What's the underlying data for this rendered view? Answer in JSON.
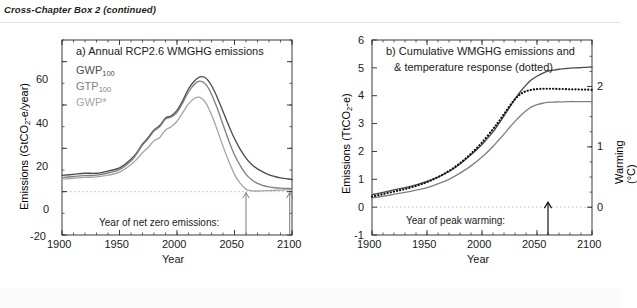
{
  "header": {
    "title": "Cross-Chapter Box 2 (continued)"
  },
  "panel_a": {
    "title": "a) Annual RCP2.6 WMGHG emissions",
    "ylabel": "Emissions (GtCO",
    "ylabel_sub": "2",
    "ylabel_end": "-e/year)",
    "xlabel": "Year",
    "annotation": "Year of net zero emissions:",
    "legend": [
      {
        "label": "GWP",
        "sub": "100",
        "color": "#4d4d4d"
      },
      {
        "label": "GTP",
        "sub": "100",
        "color": "#808080"
      },
      {
        "label": "GWP*",
        "sub": "",
        "color": "#a6a6a6"
      }
    ],
    "yticks": [
      "-20",
      "0",
      "20",
      "40",
      "60"
    ],
    "xticks": [
      "1900",
      "1950",
      "2000",
      "2050",
      "2100"
    ]
  },
  "panel_b": {
    "title_line1": "b) Cumulative WMGHG emissions and",
    "title_line2": "& temperature response (dotted)",
    "ylabel": "Emissions (TtCO",
    "ylabel_sub": "2",
    "ylabel_end": "-e)",
    "ylabel_right": "Warming (°C)",
    "xlabel": "Year",
    "annotation": "Year of peak warming:",
    "yticks": [
      "-1",
      "0",
      "1",
      "2",
      "3",
      "4",
      "5",
      "6"
    ],
    "yticks_right": [
      "0",
      "1",
      "2"
    ],
    "xticks": [
      "1900",
      "1950",
      "2000",
      "2050",
      "2100"
    ]
  },
  "chart_data": [
    {
      "type": "line",
      "panel": "a",
      "title": "a) Annual RCP2.6 WMGHG emissions",
      "xlabel": "Year",
      "ylabel": "Emissions (GtCO2-e/year)",
      "xlim": [
        1900,
        2100
      ],
      "ylim": [
        -20,
        70
      ],
      "yticks": [
        -20,
        0,
        20,
        40,
        60
      ],
      "xticks": [
        1900,
        1950,
        2000,
        2050,
        2100
      ],
      "grid": false,
      "legend_position": "upper-left",
      "zero_line": 0,
      "annotations": [
        {
          "text": "Year of net zero emissions:",
          "x": 2000,
          "y": -12
        },
        {
          "type": "arrow",
          "x": 2060,
          "y": 0,
          "series": "GWP*"
        },
        {
          "type": "arrow",
          "x": 2098,
          "y": 0,
          "series": "GWP100"
        }
      ],
      "x": [
        1900,
        1910,
        1920,
        1930,
        1940,
        1950,
        1960,
        1965,
        1970,
        1975,
        1980,
        1985,
        1990,
        1995,
        2000,
        2005,
        2010,
        2015,
        2020,
        2025,
        2030,
        2035,
        2040,
        2045,
        2050,
        2055,
        2060,
        2065,
        2070,
        2075,
        2080,
        2085,
        2090,
        2095,
        2100
      ],
      "series": [
        {
          "name": "GWP100",
          "color": "#4d4d4d",
          "values": [
            7.5,
            8.0,
            8.5,
            8.5,
            9.5,
            11.0,
            15.0,
            18.0,
            22.0,
            25.0,
            28.5,
            30.5,
            34.0,
            35.0,
            37.5,
            42.0,
            47.5,
            51.0,
            53.0,
            52.5,
            49.0,
            43.5,
            37.0,
            30.5,
            24.5,
            19.5,
            15.5,
            12.5,
            10.5,
            9.0,
            7.8,
            7.0,
            6.4,
            6.0,
            5.6
          ]
        },
        {
          "name": "GTP100",
          "color": "#808080",
          "values": [
            6.5,
            7.0,
            7.4,
            7.6,
            8.6,
            10.2,
            14.2,
            17.5,
            21.5,
            24.5,
            28.0,
            30.0,
            33.5,
            34.5,
            36.5,
            41.0,
            46.0,
            49.5,
            51.0,
            49.5,
            45.0,
            38.5,
            31.0,
            23.5,
            17.0,
            12.0,
            8.0,
            5.5,
            3.8,
            2.8,
            2.2,
            1.8,
            1.6,
            1.5,
            1.4
          ]
        },
        {
          "name": "GWP*",
          "color": "#a6a6a6",
          "values": [
            5.8,
            6.2,
            6.6,
            6.8,
            7.6,
            9.0,
            12.5,
            15.0,
            18.0,
            20.5,
            23.5,
            25.0,
            28.5,
            30.0,
            32.5,
            36.5,
            40.5,
            43.0,
            43.5,
            41.0,
            35.5,
            28.5,
            21.0,
            14.0,
            8.0,
            3.8,
            1.2,
            0.4,
            0.3,
            0.4,
            0.5,
            0.6,
            0.7,
            0.8,
            0.9
          ]
        }
      ]
    },
    {
      "type": "line",
      "panel": "b",
      "title": "b) Cumulative WMGHG emissions and & temperature response (dotted)",
      "xlabel": "Year",
      "ylabel": "Emissions (TtCO2-e)",
      "ylabel_right": "Warming (°C)",
      "xlim": [
        1900,
        2100
      ],
      "ylim": [
        -1,
        6
      ],
      "ylim_right": [
        -0.46,
        2.77
      ],
      "yticks": [
        -1,
        0,
        1,
        2,
        3,
        4,
        5,
        6
      ],
      "yticks_right": [
        0,
        1,
        2
      ],
      "xticks": [
        1900,
        1950,
        2000,
        2050,
        2100
      ],
      "grid": false,
      "zero_line": 0,
      "annotations": [
        {
          "text": "Year of peak warming:",
          "x": 2000,
          "y": -0.55
        },
        {
          "type": "arrow",
          "x": 2060,
          "y": 0
        }
      ],
      "x": [
        1900,
        1910,
        1920,
        1930,
        1940,
        1950,
        1960,
        1970,
        1980,
        1990,
        2000,
        2010,
        2015,
        2020,
        2025,
        2030,
        2035,
        2040,
        2045,
        2050,
        2055,
        2060,
        2065,
        2070,
        2075,
        2080,
        2085,
        2090,
        2095,
        2100
      ],
      "series": [
        {
          "name": "GWP100 cumulative",
          "color": "#4d4d4d",
          "style": "solid",
          "values": [
            0.45,
            0.53,
            0.62,
            0.7,
            0.8,
            0.92,
            1.08,
            1.28,
            1.55,
            1.88,
            2.25,
            2.7,
            2.98,
            3.28,
            3.58,
            3.88,
            4.15,
            4.38,
            4.57,
            4.7,
            4.8,
            4.88,
            4.92,
            4.95,
            4.97,
            4.99,
            5.0,
            5.01,
            5.02,
            5.03
          ]
        },
        {
          "name": "GWP* cumulative",
          "color": "#808080",
          "style": "solid",
          "values": [
            0.33,
            0.39,
            0.46,
            0.53,
            0.61,
            0.7,
            0.84,
            1.0,
            1.22,
            1.48,
            1.8,
            2.18,
            2.4,
            2.62,
            2.86,
            3.08,
            3.28,
            3.46,
            3.6,
            3.68,
            3.73,
            3.76,
            3.77,
            3.78,
            3.78,
            3.79,
            3.79,
            3.79,
            3.79,
            3.79
          ]
        },
        {
          "name": "Temperature response",
          "color": "#111111",
          "style": "dotted",
          "values": [
            0.38,
            0.47,
            0.56,
            0.65,
            0.76,
            0.9,
            1.08,
            1.3,
            1.58,
            1.92,
            2.32,
            2.8,
            3.06,
            3.34,
            3.62,
            3.88,
            4.06,
            4.16,
            4.21,
            4.24,
            4.25,
            4.25,
            4.25,
            4.24,
            4.24,
            4.23,
            4.23,
            4.22,
            4.22,
            4.21
          ]
        }
      ]
    }
  ]
}
